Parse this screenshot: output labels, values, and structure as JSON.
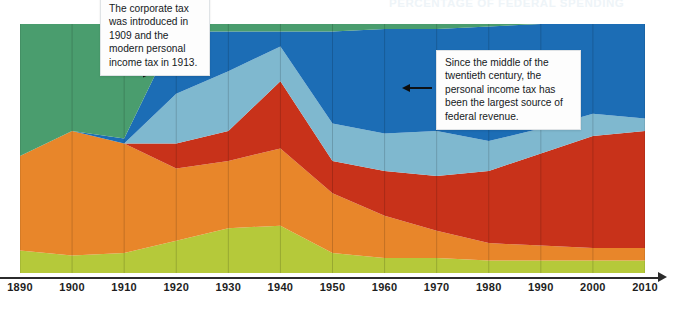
{
  "chart": {
    "title": "PERCENTAGE OF FEDERAL SPENDING",
    "axis": {
      "xlabel": "",
      "ylabel": "",
      "ticks": [
        "1890",
        "1900",
        "1910",
        "1920",
        "1930",
        "1940",
        "1950",
        "1960",
        "1970",
        "1980",
        "1990",
        "2000",
        "2010"
      ]
    },
    "annotations": [
      {
        "id": "callout-1",
        "text": "The corporate tax was introduced in 1909 and the modern personal income tax in 1913.",
        "arrow": "elbow-right"
      },
      {
        "id": "callout-2",
        "text": "Since the middle of the twentieth century, the personal income tax has been the largest source of federal revenue.",
        "arrow": "left"
      }
    ],
    "colors": {
      "green": "#4a9d6e",
      "blue": "#1c6db5",
      "light_blue": "#7fb8cf",
      "red": "#c8321a",
      "orange": "#e8862a",
      "yellow_green": "#b5c93a",
      "axis": "#2b2b2b",
      "background": "#ffffff"
    }
  },
  "chart_data": {
    "type": "area",
    "title": "PERCENTAGE OF FEDERAL SPENDING",
    "subtitle": "",
    "xlabel": "",
    "ylabel": "",
    "stacked": true,
    "normalized": true,
    "grid": true,
    "legend": "none",
    "ylim": [
      0,
      100
    ],
    "categories": [
      1890,
      1900,
      1910,
      1920,
      1930,
      1940,
      1950,
      1960,
      1970,
      1980,
      1990,
      2000,
      2010
    ],
    "series": [
      {
        "name": "other-receipts",
        "color": "#b5c93a",
        "values": [
          9,
          7,
          8,
          13,
          18,
          19,
          8,
          6,
          6,
          5,
          5,
          5,
          5
        ]
      },
      {
        "name": "excise-and-customs",
        "color": "#e8862a",
        "values": [
          38,
          50,
          44,
          29,
          27,
          31,
          24,
          17,
          11,
          7,
          6,
          5,
          5
        ]
      },
      {
        "name": "corporate-income-tax",
        "color": "#c8321a",
        "values": [
          0,
          0,
          0,
          10,
          12,
          27,
          13,
          18,
          22,
          29,
          37,
          45,
          47
        ]
      },
      {
        "name": "payroll-social-insurance",
        "color": "#7fb8cf",
        "values": [
          0,
          0,
          0,
          20,
          24,
          14,
          15,
          15,
          18,
          12,
          10,
          9,
          5
        ]
      },
      {
        "name": "personal-income-tax",
        "color": "#1c6db5",
        "values": [
          0,
          0,
          2,
          25,
          16,
          6,
          37,
          42,
          41,
          46,
          42,
          36,
          38
        ]
      },
      {
        "name": "tariffs-and-land-sales",
        "color": "#4a9d6e",
        "values": [
          53,
          43,
          46,
          3,
          3,
          3,
          3,
          2,
          2,
          1,
          0,
          0,
          0
        ]
      }
    ]
  }
}
